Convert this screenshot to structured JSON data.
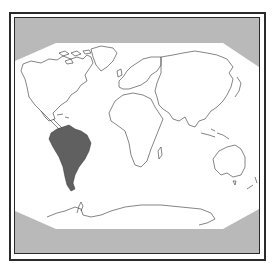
{
  "map": {
    "type": "world outline map",
    "highlighted_region": "South America",
    "colors": {
      "background_gray": "#b9b9b9",
      "land_fill": "#ffffff",
      "outline": "#333333",
      "highlight_fill": "#606060",
      "frame": "#2a2a2a"
    },
    "continents": [
      "North America",
      "South America",
      "Europe",
      "Africa",
      "Asia",
      "Australia",
      "Antarctica"
    ]
  }
}
